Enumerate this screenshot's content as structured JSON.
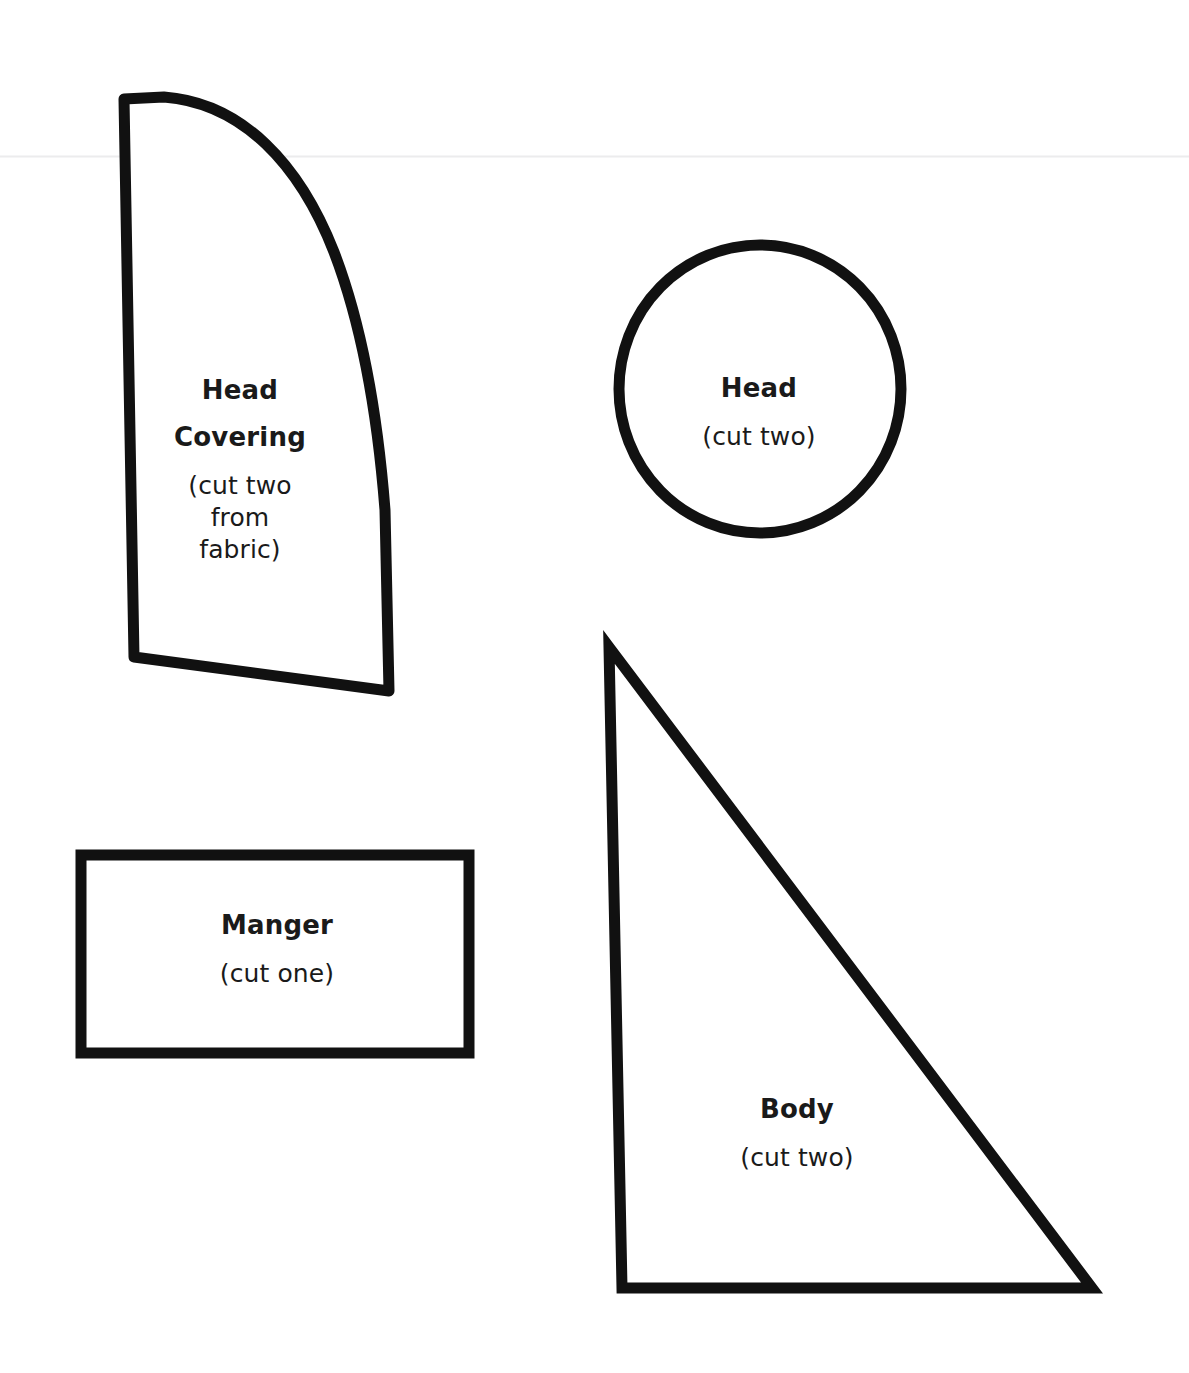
{
  "sheet": {
    "title": "Nativity Craft Pattern Sheet",
    "background_color": "#ffffff",
    "ink_color": "#111111",
    "scan_line_color": "#ececed",
    "width": 1189,
    "height": 1373
  },
  "pieces": [
    {
      "id": "head-covering",
      "shape": "curved-quadrilateral",
      "title": "Head",
      "title2": "Covering",
      "subtitle": "(cut two\nfrom\nfabric)",
      "cut_count": "two",
      "material": "fabric"
    },
    {
      "id": "head",
      "shape": "circle",
      "title": "Head",
      "subtitle": "(cut two)",
      "cut_count": "two"
    },
    {
      "id": "manger",
      "shape": "rectangle",
      "title": "Manger",
      "subtitle": "(cut one)",
      "cut_count": "one"
    },
    {
      "id": "body",
      "shape": "right-triangle",
      "title": "Body",
      "subtitle": "(cut two)",
      "cut_count": "two"
    }
  ]
}
